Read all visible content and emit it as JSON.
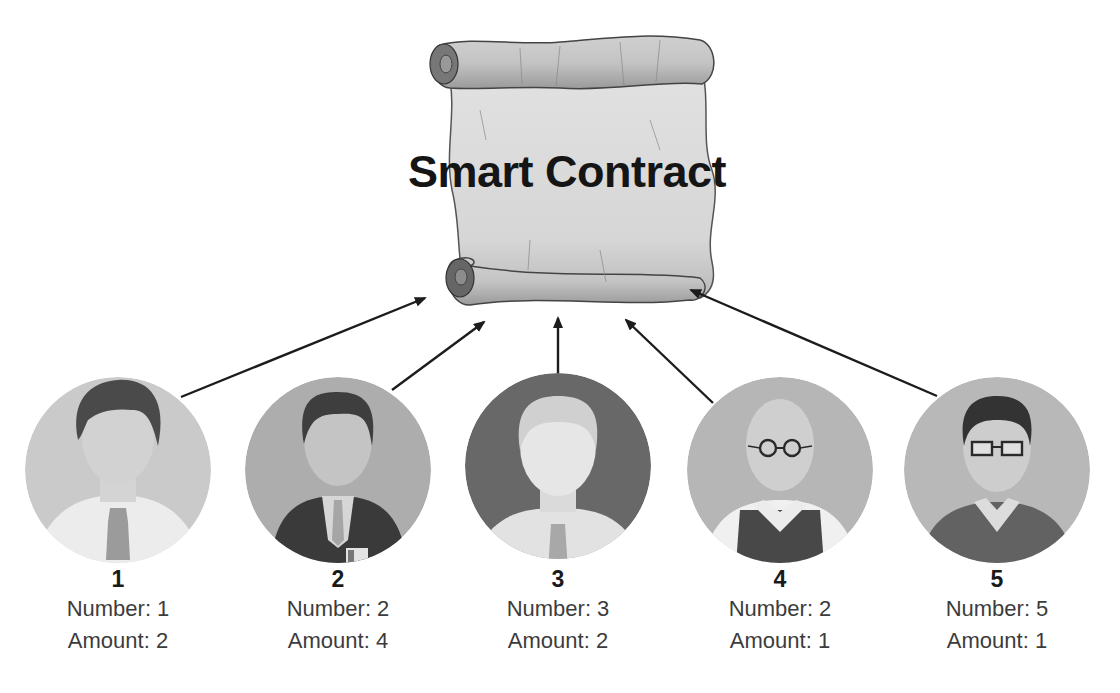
{
  "diagram": {
    "title": "Smart Contract",
    "center_node": {
      "label": "Smart Contract",
      "icon": "scroll-icon"
    },
    "participants": [
      {
        "id": "1",
        "number_label": "Number: 1",
        "amount_label": "Amount: 2",
        "number": 1,
        "amount": 2,
        "avatar": "young-man-shirt-tie-avatar",
        "bg_color": "#c9c9c9"
      },
      {
        "id": "2",
        "number_label": "Number: 2",
        "amount_label": "Amount: 4",
        "number": 2,
        "amount": 4,
        "avatar": "businessman-suit-badge-avatar",
        "bg_color": "#ababab"
      },
      {
        "id": "3",
        "number_label": "Number: 3",
        "amount_label": "Amount: 2",
        "number": 3,
        "amount": 2,
        "avatar": "man-shirt-tie-avatar",
        "bg_color": "#6a6a6a"
      },
      {
        "id": "4",
        "number_label": "Number: 2",
        "amount_label": "Amount: 1",
        "number": 2,
        "amount": 1,
        "avatar": "old-man-round-glasses-avatar",
        "bg_color": "#b4b4b4"
      },
      {
        "id": "5",
        "number_label": "Number: 5",
        "amount_label": "Amount: 1",
        "number": 5,
        "amount": 1,
        "avatar": "man-glasses-sweater-avatar",
        "bg_color": "#b9b9b9"
      }
    ],
    "edges": [
      {
        "from": "1",
        "to": "smart-contract"
      },
      {
        "from": "2",
        "to": "smart-contract"
      },
      {
        "from": "3",
        "to": "smart-contract"
      },
      {
        "from": "4",
        "to": "smart-contract"
      },
      {
        "from": "5",
        "to": "smart-contract"
      }
    ]
  }
}
